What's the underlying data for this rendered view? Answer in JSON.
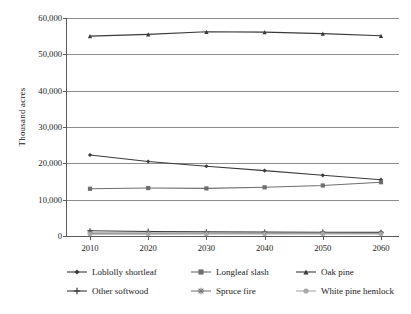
{
  "chart_data": {
    "type": "line",
    "title": "",
    "xlabel": "",
    "ylabel": "Thousand acres",
    "x": [
      2010,
      2020,
      2030,
      2040,
      2050,
      2060
    ],
    "xtick_labels": [
      "2010",
      "2020",
      "2030",
      "2040",
      "2050",
      "2060"
    ],
    "ytick_labels": [
      "0",
      "10,000",
      "20,000",
      "30,000",
      "40,000",
      "50,000",
      "60,000"
    ],
    "ytick_values": [
      0,
      10000,
      20000,
      30000,
      40000,
      50000,
      60000
    ],
    "ylim": [
      0,
      60000
    ],
    "grid": "horizontal",
    "legend_position": "below",
    "series": [
      {
        "name": "Loblolly shortleaf",
        "marker": "diamond",
        "color": "#3a3a3a",
        "values": [
          22300,
          20500,
          19200,
          18000,
          16700,
          15500
        ]
      },
      {
        "name": "Longleaf slash",
        "marker": "square",
        "color": "#6e6e6e",
        "values": [
          13000,
          13200,
          13100,
          13400,
          13900,
          14800
        ]
      },
      {
        "name": "Oak pine",
        "marker": "triangle",
        "color": "#3a3a3a",
        "values": [
          55000,
          55500,
          56200,
          56100,
          55700,
          55100
        ]
      },
      {
        "name": "Other softwood",
        "marker": "cross",
        "color": "#3a3a3a",
        "values": [
          1450,
          1250,
          1150,
          1100,
          1050,
          1000
        ]
      },
      {
        "name": "Spruce fire",
        "marker": "star",
        "color": "#7a7a7a",
        "values": [
          800,
          800,
          800,
          800,
          800,
          800
        ]
      },
      {
        "name": "White pine hemlock",
        "marker": "circle",
        "color": "#a8a8a8",
        "values": [
          500,
          520,
          540,
          550,
          560,
          560
        ]
      }
    ]
  },
  "axes": {
    "ylabel": "Thousand acres"
  },
  "legend": {
    "rows": [
      [
        {
          "label": "Loblolly shortleaf",
          "series": 0
        },
        {
          "label": "Longleaf slash",
          "series": 1
        },
        {
          "label": "Oak pine",
          "series": 2
        }
      ],
      [
        {
          "label": "Other softwood",
          "series": 3
        },
        {
          "label": "Spruce fire",
          "series": 4
        },
        {
          "label": "White pine hemlock",
          "series": 5
        }
      ]
    ]
  },
  "colors": {
    "axis": "#5a5a5a",
    "grid": "#8d8d8d",
    "background": "#ffffff",
    "text": "#1a1a1a"
  }
}
